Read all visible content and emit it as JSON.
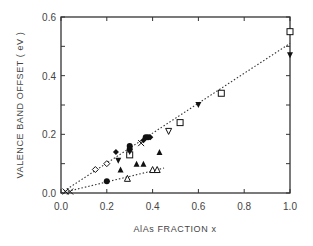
{
  "chart_data": {
    "type": "scatter",
    "title": "",
    "xlabel": "AlAs FRACTION x",
    "ylabel": "VALENCE BAND OFFSET ( eV )",
    "xlim": [
      0.0,
      1.0
    ],
    "ylim": [
      0.0,
      0.6
    ],
    "xticks": [
      "0.0",
      "0.2",
      "0.4",
      "0.6",
      "0.8",
      "1.0"
    ],
    "yticks": [
      "0.0",
      "0.2",
      "0.4",
      "0.6"
    ],
    "grid": false,
    "legend": "none",
    "fit_lines": [
      {
        "name": "upper-fit",
        "style": "dotted",
        "x": [
          0.0,
          1.0
        ],
        "y": [
          0.0,
          0.51
        ]
      },
      {
        "name": "lower-fit",
        "style": "dotted",
        "x": [
          0.0,
          0.45
        ],
        "y": [
          0.0,
          0.085
        ]
      }
    ],
    "series": [
      {
        "name": "open-square",
        "marker": "square-open",
        "points": [
          [
            0.3,
            0.13
          ],
          [
            0.52,
            0.24
          ],
          [
            0.7,
            0.34
          ],
          [
            1.0,
            0.55
          ]
        ]
      },
      {
        "name": "filled-inverted-triangle",
        "marker": "triangle-down-filled",
        "points": [
          [
            0.25,
            0.11
          ],
          [
            0.3,
            0.14
          ],
          [
            0.6,
            0.3
          ],
          [
            1.0,
            0.47
          ]
        ]
      },
      {
        "name": "open-inverted-triangle",
        "marker": "triangle-down-open",
        "points": [
          [
            0.47,
            0.21
          ]
        ]
      },
      {
        "name": "filled-circle",
        "marker": "circle-filled",
        "points": [
          [
            0.2,
            0.04
          ],
          [
            0.3,
            0.16
          ],
          [
            0.3,
            0.15
          ],
          [
            0.37,
            0.19
          ],
          [
            0.38,
            0.19
          ]
        ]
      },
      {
        "name": "filled-diamond",
        "marker": "diamond-filled",
        "points": [
          [
            0.24,
            0.14
          ],
          [
            0.36,
            0.18
          ],
          [
            0.39,
            0.19
          ]
        ]
      },
      {
        "name": "open-diamond",
        "marker": "diamond-open",
        "points": [
          [
            0.15,
            0.08
          ],
          [
            0.2,
            0.1
          ]
        ]
      },
      {
        "name": "filled-triangle",
        "marker": "triangle-up-filled",
        "points": [
          [
            0.26,
            0.08
          ],
          [
            0.33,
            0.1
          ],
          [
            0.36,
            0.1
          ],
          [
            0.43,
            0.14
          ]
        ]
      },
      {
        "name": "open-triangle",
        "marker": "triangle-up-open",
        "points": [
          [
            0.29,
            0.05
          ],
          [
            0.4,
            0.08
          ],
          [
            0.42,
            0.08
          ]
        ]
      },
      {
        "name": "cross",
        "marker": "cross",
        "points": [
          [
            0.35,
            0.17
          ],
          [
            0.02,
            0.005
          ],
          [
            0.04,
            0.005
          ]
        ]
      }
    ]
  }
}
